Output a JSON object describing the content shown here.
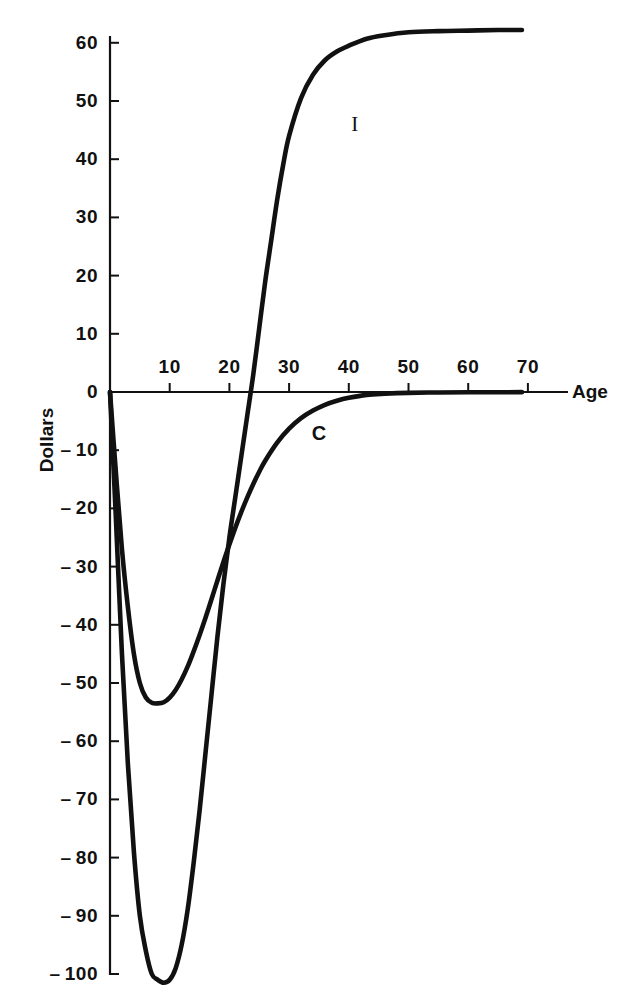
{
  "chart_data": {
    "type": "line",
    "title": "",
    "subtitle": "",
    "xlabel": "Age",
    "ylabel": "Dollars",
    "xlim": [
      0,
      75
    ],
    "ylim": [
      -105,
      65
    ],
    "grid": false,
    "legend": "inline-curve-labels",
    "x_ticks": [
      10,
      20,
      30,
      40,
      50,
      60,
      70
    ],
    "x_tick_labels": [
      "10",
      "20",
      "30",
      "40",
      "50",
      "60",
      "70"
    ],
    "y_ticks": [
      60,
      50,
      40,
      30,
      20,
      10,
      0,
      -10,
      -20,
      -30,
      -40,
      -50,
      -60,
      -70,
      -80,
      -90,
      -100
    ],
    "y_tick_labels": [
      "60",
      "50",
      "40",
      "30",
      "20",
      "10",
      "0",
      "-10",
      "-20",
      "-30",
      "-40",
      "-50",
      "-60",
      "-70",
      "-80",
      "-90",
      "-100"
    ],
    "axis_color": "#111111",
    "curve_color": "#111111",
    "series": [
      {
        "name": "I",
        "label": "I",
        "label_x": 41,
        "label_y": 46,
        "x": [
          0,
          1,
          2,
          3,
          4,
          5,
          6,
          7,
          8,
          9,
          10,
          11,
          12,
          13,
          14,
          15,
          16,
          17,
          18,
          19,
          20,
          21,
          22,
          23,
          24,
          25,
          26,
          27,
          28,
          29,
          30,
          32,
          34,
          36,
          38,
          40,
          43,
          46,
          50,
          55,
          60,
          65,
          69
        ],
        "y": [
          0,
          -22,
          -45,
          -64,
          -79,
          -90,
          -96,
          -100,
          -101,
          -101.5,
          -101,
          -99,
          -95,
          -89,
          -81,
          -72,
          -62,
          -52,
          -42,
          -33,
          -25,
          -18,
          -11,
          -4,
          3,
          11,
          19,
          26,
          33,
          39,
          44,
          50.5,
          54.5,
          57,
          58.5,
          59.5,
          60.7,
          61.3,
          61.8,
          62,
          62.1,
          62.2,
          62.2
        ]
      },
      {
        "name": "C",
        "label": "C",
        "label_x": 35,
        "label_y": -7,
        "x": [
          0,
          1,
          2,
          3,
          4,
          5,
          6,
          7,
          8,
          9,
          10,
          11,
          12,
          13,
          14,
          15,
          16,
          17,
          18,
          19,
          20,
          21,
          22,
          23,
          24,
          25,
          26,
          28,
          30,
          32,
          34,
          36,
          38,
          40,
          43,
          46,
          50,
          55,
          60,
          65,
          69
        ],
        "y": [
          0,
          -14,
          -27,
          -37,
          -45,
          -50,
          -52.5,
          -53.4,
          -53.5,
          -53.3,
          -52.5,
          -51.2,
          -49.4,
          -47.2,
          -44.6,
          -41.8,
          -38.8,
          -35.6,
          -32.4,
          -29.2,
          -26.2,
          -23.3,
          -20.6,
          -18.1,
          -15.8,
          -13.7,
          -11.8,
          -8.7,
          -6.3,
          -4.5,
          -3.2,
          -2.2,
          -1.5,
          -1.0,
          -0.5,
          -0.3,
          -0.15,
          -0.08,
          -0.05,
          -0.04,
          -0.03
        ]
      }
    ],
    "annotations": []
  }
}
